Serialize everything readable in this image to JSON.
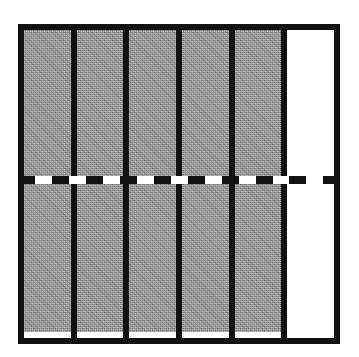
{
  "figure": {
    "title": "",
    "caption": "",
    "frame_color": "#111111",
    "background_color": "#ffffff",
    "bar_fill_color": "#9b9b9b",
    "empty_bar_color": "#ffffff",
    "divider_color": "#111111"
  },
  "threshold": {
    "visible": true,
    "style": "dashed",
    "color": "#111111",
    "label": ""
  },
  "chart_data": {
    "type": "bar",
    "title": "",
    "subtitle": "",
    "xlabel": "",
    "ylabel": "",
    "categories": [
      "1",
      "2",
      "3",
      "4",
      "5",
      "6"
    ],
    "values": [
      100,
      100,
      100,
      100,
      100,
      0
    ],
    "ylim": [
      0,
      100
    ],
    "xlim": [
      0,
      6
    ],
    "grid": false,
    "legend": [],
    "legend_position": "none",
    "tick_labels_x": [],
    "tick_labels_y": [],
    "annotations": [
      {
        "type": "hline",
        "value": 52,
        "style": "dashed",
        "color": "#111111",
        "label": ""
      }
    ],
    "bar_states": [
      "filled",
      "filled",
      "filled",
      "filled",
      "filled",
      "empty"
    ]
  }
}
